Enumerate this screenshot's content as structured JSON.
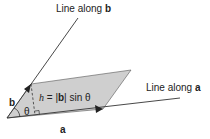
{
  "diagram": {
    "labels": {
      "line_b_prefix": "Line along ",
      "line_b_vec": "b",
      "line_a_prefix": "Line along ",
      "line_a_vec": "a",
      "vec_a": "a",
      "vec_b": "b",
      "theta": "θ",
      "height_var": "h",
      "height_eq": " = |",
      "height_vec": "b",
      "height_tail": "| sin θ"
    },
    "colors": {
      "fill": "#cfcfcf",
      "stroke": "#333333",
      "text": "#222222"
    }
  }
}
